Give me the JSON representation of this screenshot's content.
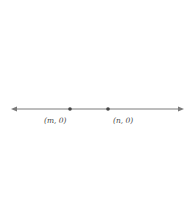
{
  "diagram": {
    "type": "family-of-parabolas",
    "points": [
      {
        "id": "m",
        "label": "(m, 0)",
        "x": 70,
        "y": 109
      },
      {
        "id": "n",
        "label": "(n, 0)",
        "x": 108,
        "y": 109
      }
    ],
    "axis": {
      "y": 109,
      "x_start": 11,
      "x_end": 184,
      "arrows": "both"
    },
    "parabolas": [
      {
        "vertex_y": 119
      },
      {
        "vertex_y": 128
      },
      {
        "vertex_y": 147
      },
      {
        "vertex_y": 186
      }
    ],
    "colors": {
      "curve": "#6e6e6e",
      "axis": "#7a7a7a",
      "dot": "#444444",
      "text": "#444444"
    }
  }
}
